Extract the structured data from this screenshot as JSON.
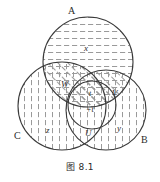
{
  "figure": {
    "caption": "图 8.1",
    "type": "venn-diagram",
    "background_color": "#ffffff",
    "stroke_color": "#3a3a3a",
    "hatch_color": "#9a9a9a",
    "circles": [
      {
        "id": "A",
        "label": "A",
        "cx": 88,
        "cy": 62,
        "r": 45,
        "hatch": "horizontal",
        "label_x": 68,
        "label_y": 14
      },
      {
        "id": "C",
        "label": "C",
        "cx": 62,
        "cy": 106,
        "r": 44,
        "hatch": "vertical",
        "label_x": 14,
        "label_y": 139
      },
      {
        "id": "B",
        "label": "B",
        "cx": 106,
        "cy": 110,
        "r": 40,
        "hatch": "vertical",
        "label_x": 141,
        "label_y": 143
      },
      {
        "id": "inner",
        "label": "",
        "cx": 92,
        "cy": 105,
        "r": 24,
        "hatch": "none",
        "label_x": 0,
        "label_y": 0
      }
    ],
    "region_labels": [
      {
        "name": "x",
        "text": "x",
        "x": 84,
        "y": 51
      },
      {
        "name": "W",
        "text": "W",
        "x": 61,
        "y": 87
      },
      {
        "name": "V",
        "text": "V",
        "x": 112,
        "y": 96
      },
      {
        "name": "t-upper",
        "text": "t",
        "x": 89,
        "y": 96
      },
      {
        "name": "t-lower",
        "text": "+t",
        "x": 91,
        "y": 111
      },
      {
        "name": "U",
        "text": "U",
        "x": 88,
        "y": 134
      },
      {
        "name": "z",
        "text": "z",
        "x": 48,
        "y": 133
      },
      {
        "name": "y",
        "text": "y",
        "x": 118,
        "y": 131
      }
    ]
  }
}
